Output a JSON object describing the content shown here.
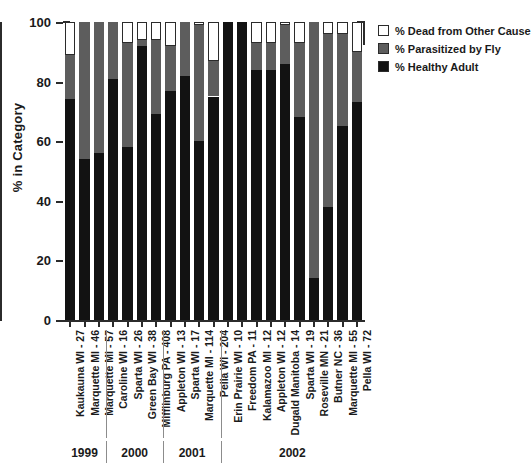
{
  "chart_data": {
    "type": "bar",
    "subtype": "stacked-percentage",
    "title": "",
    "xlabel": "",
    "ylabel": "% in Category",
    "ylim": [
      0,
      100
    ],
    "yticks": [
      0,
      20,
      40,
      60,
      80,
      100
    ],
    "grid": false,
    "legend_position": "top-right",
    "categories": [
      "Kaukauna WI - 27",
      "Marquette MI - 46",
      "Marquette MI - 57",
      "Caroline WI - 16",
      "Sparta WI - 26",
      "Green Bay WI - 38",
      "Mifflinburg PA - 408",
      "Appleton WI - 13",
      "Sparta WI - 17",
      "Marquette MI - 114",
      "Pella WI - 204",
      "Erin Prairie WI - 10",
      "Freedom PA - 11",
      "Kalamazoo MI - 12",
      "Appleton WI - 12",
      "Dugald Manitoba - 14",
      "Sparta WI - 19",
      "Roseville MN - 21",
      "Butner NC - 36",
      "Marquette MI - 55",
      "Pella WI - 72"
    ],
    "series": [
      {
        "name": "% Healthy Adult",
        "color": "#121212",
        "values": [
          74,
          54,
          56,
          81,
          58,
          92,
          69,
          77,
          82,
          60,
          75,
          100,
          100,
          84,
          84,
          86,
          68,
          14,
          38,
          65,
          73
        ]
      },
      {
        "name": "% Parasitized by Fly",
        "color": "#5d5d5d",
        "values": [
          15,
          46,
          44,
          19,
          35,
          2,
          25,
          15,
          18,
          39,
          12,
          0,
          0,
          9,
          9,
          13,
          25,
          86,
          58,
          31,
          17
        ]
      },
      {
        "name": "% Dead from Other Cause",
        "color": "#ffffff",
        "values": [
          11,
          0,
          0,
          0,
          7,
          6,
          6,
          8,
          0,
          1,
          13,
          0,
          0,
          7,
          7,
          1,
          7,
          0,
          4,
          4,
          10
        ]
      }
    ],
    "groups": [
      {
        "label": "1999",
        "start": 0,
        "end": 2
      },
      {
        "label": "2000",
        "start": 3,
        "end": 6
      },
      {
        "label": "2001",
        "start": 7,
        "end": 10
      },
      {
        "label": "2002",
        "start": 11,
        "end": 20
      }
    ]
  },
  "legend": {
    "items": [
      {
        "label": "% Dead from Other Cause",
        "swatch": "white-swatch-icon"
      },
      {
        "label": "% Parasitized by Fly",
        "swatch": "gray-swatch-icon"
      },
      {
        "label": "% Healthy Adult",
        "swatch": "black-swatch-icon"
      }
    ]
  },
  "axis": {
    "y_title": "% in Category"
  }
}
